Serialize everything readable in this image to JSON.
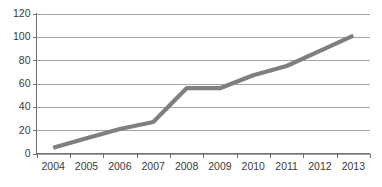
{
  "chart_data": {
    "type": "line",
    "title": "",
    "subtitle": "",
    "xlabel": "",
    "ylabel": "",
    "categories": [
      "2004",
      "2005",
      "2006",
      "2007",
      "2008",
      "2009",
      "2010",
      "2011",
      "2012",
      "2013"
    ],
    "series": [
      {
        "name": "Series 1",
        "color": "#7f7f7f",
        "values": [
          5,
          13,
          21,
          27,
          56,
          56,
          67,
          75,
          88,
          101
        ]
      }
    ],
    "ylim": [
      0,
      120
    ],
    "yticks": [
      0,
      20,
      40,
      60,
      80,
      100,
      120
    ],
    "ytick_labels": [
      "0",
      "20",
      "40",
      "60",
      "80",
      "100",
      "120"
    ],
    "xtick_labels": [
      "2004",
      "2005",
      "2006",
      "2007",
      "2008",
      "2009",
      "2010",
      "2011",
      "2012",
      "2013"
    ],
    "grid": true,
    "grid_axis": "y",
    "legend": false,
    "legend_position": "none",
    "annotations": []
  },
  "colors": {
    "series_line": "#7f7f7f",
    "gridline": "#9a9a9a",
    "axis": "#6e6e6e",
    "tick_label": "#3a3a3a",
    "background": "#ffffff"
  }
}
